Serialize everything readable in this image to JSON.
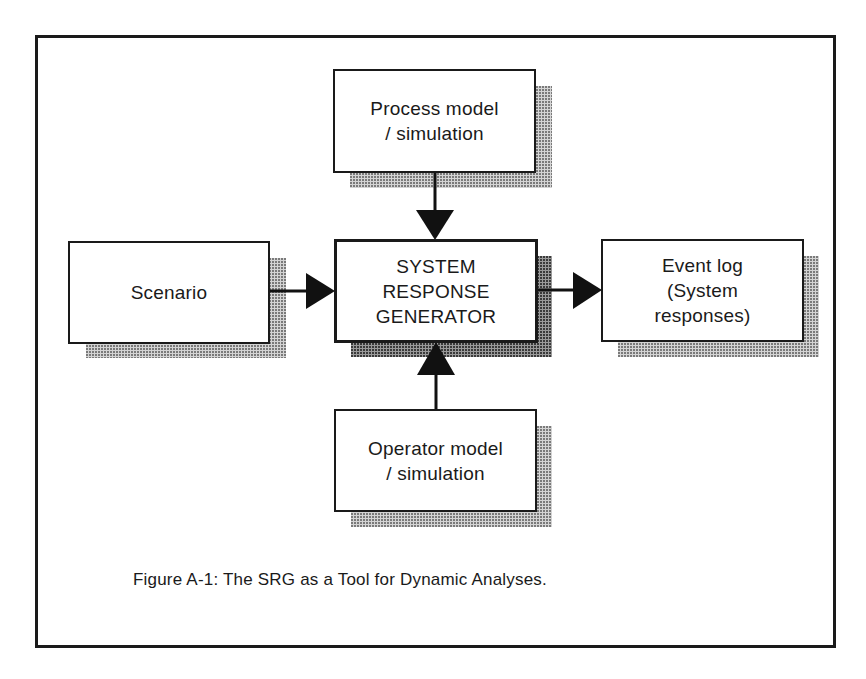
{
  "figure": {
    "caption": "Figure A-1: The SRG as a Tool for Dynamic Analyses.",
    "nodes": {
      "process": {
        "label": "Process model\n/ simulation"
      },
      "scenario": {
        "label": "Scenario"
      },
      "srg": {
        "label": "SYSTEM\nRESPONSE\nGENERATOR"
      },
      "event_log": {
        "label": "Event log\n(System\nresponses)"
      },
      "operator": {
        "label": "Operator model\n/ simulation"
      }
    },
    "edges": [
      {
        "from": "process",
        "to": "srg"
      },
      {
        "from": "scenario",
        "to": "srg"
      },
      {
        "from": "operator",
        "to": "srg"
      },
      {
        "from": "srg",
        "to": "event_log"
      }
    ]
  }
}
